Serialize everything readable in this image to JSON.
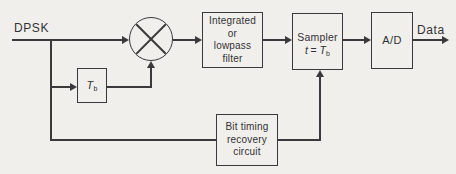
{
  "labels": {
    "input": "DPSK",
    "output": "Data"
  },
  "blocks": {
    "delay": {
      "symbol": "T",
      "subscript": "b"
    },
    "filter": {
      "line1": "Integrated",
      "line2": "or",
      "line3": "lowpass",
      "line4": "filter"
    },
    "sampler": {
      "line1": "Sampler",
      "var": "t",
      "eq": "=",
      "symbol": "T",
      "subscript": "b"
    },
    "adc": {
      "label": "A/D"
    },
    "bit_timing": {
      "line1": "Bit timing",
      "line2": "recovery",
      "line3": "circuit"
    }
  },
  "icons": {
    "mixer": "multiply-circle-icon"
  },
  "colors": {
    "background": "#f1efec",
    "line": "#3a393b",
    "text": "#323234"
  }
}
